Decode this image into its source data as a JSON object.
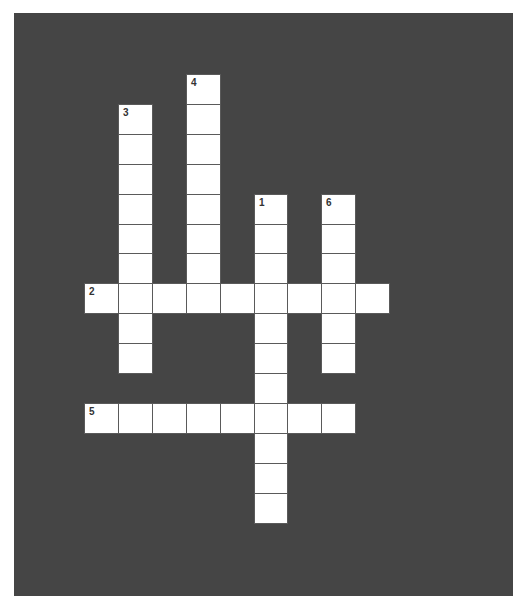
{
  "puzzle": {
    "grid": {
      "origin_x": 84,
      "origin_y": 74,
      "cell_w": 33.9,
      "cell_h": 29.9
    },
    "colors": {
      "board": "#454545",
      "cell": "#ffffff",
      "cell_border": "#5a5a5a",
      "number": "#333333"
    },
    "entries": [
      {
        "number": "1",
        "direction": "down",
        "col": 5,
        "row": 4,
        "length": 11
      },
      {
        "number": "2",
        "direction": "across",
        "col": 0,
        "row": 7,
        "length": 9
      },
      {
        "number": "3",
        "direction": "down",
        "col": 1,
        "row": 1,
        "length": 9
      },
      {
        "number": "4",
        "direction": "down",
        "col": 3,
        "row": 0,
        "length": 8
      },
      {
        "number": "5",
        "direction": "across",
        "col": 0,
        "row": 11,
        "length": 8
      },
      {
        "number": "6",
        "direction": "down",
        "col": 7,
        "row": 4,
        "length": 6
      }
    ]
  }
}
